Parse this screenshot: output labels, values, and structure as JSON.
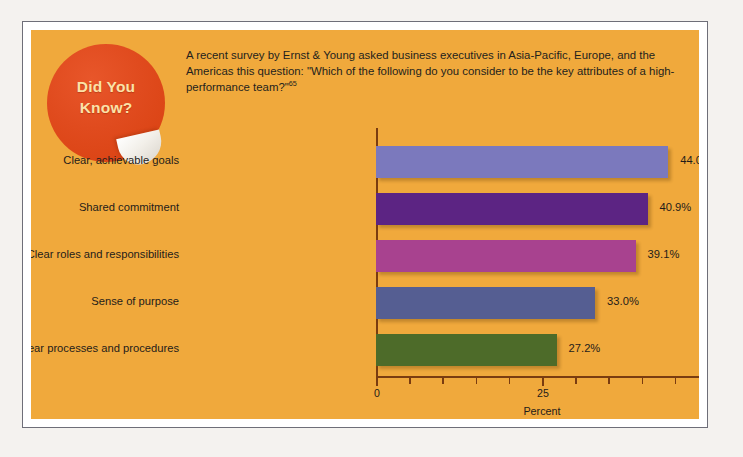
{
  "badge": {
    "line1": "Did You",
    "line2": "Know?",
    "name": "did-you-know-badge"
  },
  "intro": {
    "text": "A recent survey by Ernst & Young asked business executives in Asia-Pacific, Europe, and the Americas this question: \"Which of the following do you consider to be the key attributes of a high-performance team?\"",
    "footnote_marker": "65"
  },
  "colors": {
    "panel_background": "#f0a93c",
    "badge_fill": "#e04b1e",
    "badge_text": "#fbe2a8",
    "axis": "#7a3c10",
    "text": "#1f1c1a",
    "frame": "#6e6e78"
  },
  "chart_data": {
    "type": "bar",
    "orientation": "horizontal",
    "title": "",
    "xlabel": "Percent",
    "ylabel": "",
    "xlim": [
      0,
      50
    ],
    "xticks": [
      0,
      5,
      10,
      15,
      20,
      25,
      30,
      35,
      40,
      45,
      50
    ],
    "xtick_labels": [
      "0",
      "",
      "",
      "",
      "",
      "25",
      "",
      "",
      "",
      "",
      "50"
    ],
    "grid": false,
    "legend": "none",
    "categories": [
      "Clear, achievable goals",
      "Shared commitment",
      "Clear roles and responsibilities",
      "Sense of purpose",
      "Clear processes and procedures"
    ],
    "values": [
      44.0,
      40.9,
      39.1,
      33.0,
      27.2
    ],
    "value_labels": [
      "44.0%",
      "40.9%",
      "39.1%",
      "33.0%",
      "27.2%"
    ],
    "bar_colors": [
      "#7b79bd",
      "#5c2483",
      "#a8428f",
      "#555e92",
      "#4d6b29"
    ]
  }
}
